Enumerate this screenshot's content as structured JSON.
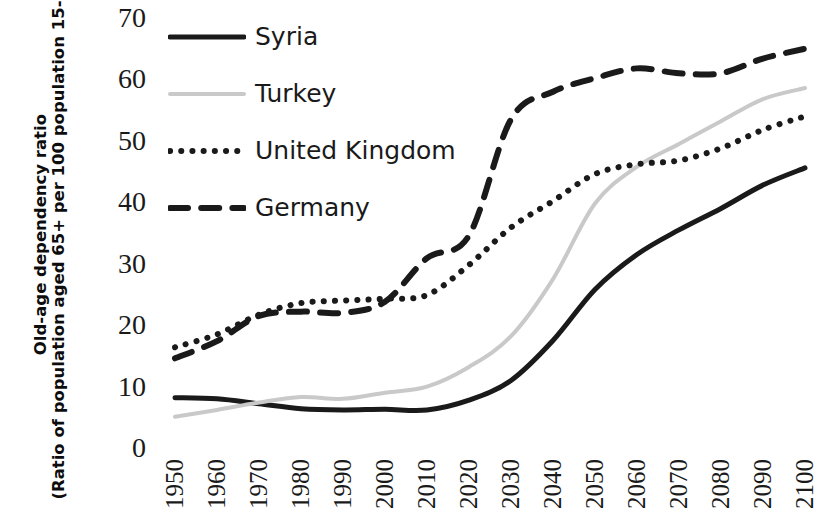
{
  "chart_data": {
    "type": "line",
    "title": "",
    "xlabel": "",
    "ylabel": "Old-age dependency ratio (Ratio of population aged 65+ per 100 population 15-64)",
    "ylabel_line1": "Old-age dependency ratio",
    "ylabel_line2": "(Ratio of population aged 65+ per 100 population 15-64)",
    "x": [
      1950,
      1960,
      1970,
      1980,
      1990,
      2000,
      2010,
      2020,
      2030,
      2040,
      2050,
      2060,
      2070,
      2080,
      2090,
      2100
    ],
    "categories": [
      "1950",
      "1960",
      "1970",
      "1980",
      "1990",
      "2000",
      "2010",
      "2020",
      "2030",
      "2040",
      "2050",
      "2060",
      "2070",
      "2080",
      "2090",
      "2100"
    ],
    "xlim": [
      1950,
      2100
    ],
    "ylim": [
      0,
      70
    ],
    "yticks": [
      0,
      10,
      20,
      30,
      40,
      50,
      60,
      70
    ],
    "ytick_labels": [
      "0",
      "10",
      "20",
      "30",
      "40",
      "50",
      "60",
      "70"
    ],
    "grid": false,
    "legend_position": "top-left",
    "series": [
      {
        "name": "Syria",
        "style": "solid",
        "color": "#1a1a1a",
        "width": 5,
        "values": [
          8.2,
          8.0,
          7.2,
          6.4,
          6.2,
          6.3,
          6.2,
          7.8,
          11.0,
          17.5,
          25.8,
          31.5,
          35.5,
          39.0,
          42.8,
          45.6
        ]
      },
      {
        "name": "Turkey",
        "style": "solid",
        "color": "#c9c9c9",
        "width": 4,
        "values": [
          5.1,
          6.2,
          7.4,
          8.3,
          8.0,
          9.0,
          10.0,
          13.2,
          18.2,
          27.5,
          39.8,
          45.8,
          49.5,
          53.2,
          56.8,
          58.6
        ]
      },
      {
        "name": "United Kingdom",
        "style": "dotted",
        "color": "#1a1a1a",
        "width": 6,
        "values": [
          16.4,
          18.5,
          21.7,
          23.6,
          24.0,
          24.3,
          24.9,
          29.8,
          35.9,
          40.2,
          44.6,
          46.2,
          46.8,
          48.8,
          51.8,
          54.0
        ]
      },
      {
        "name": "Germany",
        "style": "dashed",
        "color": "#1a1a1a",
        "width": 6,
        "values": [
          14.6,
          17.4,
          21.5,
          22.2,
          22.0,
          23.8,
          30.9,
          34.6,
          53.5,
          58.0,
          60.2,
          61.8,
          61.0,
          61.0,
          63.4,
          65.0
        ]
      }
    ]
  },
  "legend": {
    "items": [
      {
        "label": "Syria",
        "style": "solid",
        "color": "#1a1a1a"
      },
      {
        "label": "Turkey",
        "style": "solid",
        "color": "#c9c9c9"
      },
      {
        "label": "United Kingdom",
        "style": "dotted",
        "color": "#1a1a1a"
      },
      {
        "label": "Germany",
        "style": "dashed",
        "color": "#1a1a1a"
      }
    ]
  },
  "colors": {
    "background": "#ffffff",
    "text": "#1a1a1a",
    "syria": "#1a1a1a",
    "turkey": "#c9c9c9",
    "united_kingdom": "#1a1a1a",
    "germany": "#1a1a1a"
  }
}
